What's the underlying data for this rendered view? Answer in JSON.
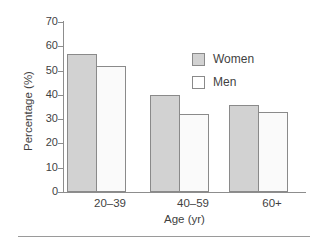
{
  "figure": {
    "top_caption_sliver": "",
    "background_color": "#ffffff"
  },
  "chart_data": {
    "type": "bar",
    "title": "",
    "xlabel": "Age (yr)",
    "ylabel": "Percentage (%)",
    "categories": [
      "20–39",
      "40–59",
      "60+"
    ],
    "series": [
      {
        "name": "Women",
        "color": "#d2d2d2",
        "values": [
          57,
          40,
          36
        ]
      },
      {
        "name": "Men",
        "color": "#fafafa",
        "values": [
          52,
          32,
          33
        ]
      }
    ],
    "ylim": [
      0,
      70
    ],
    "yticks": [
      0,
      10,
      20,
      30,
      40,
      50,
      60,
      70
    ],
    "ytick_labels": [
      "0",
      "10",
      "20",
      "30",
      "40",
      "50",
      "60",
      "70"
    ],
    "grid": false,
    "legend_position": "upper right",
    "legend_entries": [
      "Women",
      "Men"
    ]
  },
  "axes": {
    "y_title": "Percentage (%)",
    "x_title": "Age (yr)",
    "ticks": [
      {
        "label": "70",
        "value": 70
      },
      {
        "label": "60",
        "value": 60
      },
      {
        "label": "50",
        "value": 50
      },
      {
        "label": "40",
        "value": 40
      },
      {
        "label": "30",
        "value": 30
      },
      {
        "label": "20",
        "value": 20
      },
      {
        "label": "10",
        "value": 10
      },
      {
        "label": "0",
        "value": 0
      }
    ]
  },
  "legend": {
    "items": [
      {
        "label": "Women",
        "swatch": "filled-gray"
      },
      {
        "label": "Men",
        "swatch": "empty-white"
      }
    ]
  }
}
